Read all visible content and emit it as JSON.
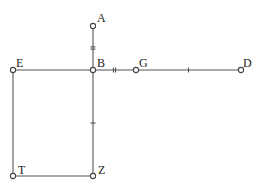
{
  "diagram": {
    "type": "geometry-figure",
    "points": [
      {
        "id": "A",
        "label": "A",
        "x": 93,
        "y": 26,
        "lx": 97,
        "ly": 22
      },
      {
        "id": "B",
        "label": "B",
        "x": 93,
        "y": 70,
        "lx": 97,
        "ly": 67
      },
      {
        "id": "E",
        "label": "E",
        "x": 13,
        "y": 70,
        "lx": 16,
        "ly": 67
      },
      {
        "id": "G",
        "label": "G",
        "x": 136,
        "y": 70,
        "lx": 139,
        "ly": 67
      },
      {
        "id": "D",
        "label": "D",
        "x": 241,
        "y": 70,
        "lx": 243,
        "ly": 67
      },
      {
        "id": "T",
        "label": "T",
        "x": 13,
        "y": 176,
        "lx": 18,
        "ly": 174
      },
      {
        "id": "Z",
        "label": "Z",
        "x": 93,
        "y": 176,
        "lx": 98,
        "ly": 174
      }
    ],
    "segments": [
      {
        "from": "A",
        "to": "B",
        "ticks": 2,
        "orientation": "vertical"
      },
      {
        "from": "E",
        "to": "B",
        "ticks": 0,
        "orientation": "horizontal"
      },
      {
        "from": "B",
        "to": "G",
        "ticks": 2,
        "orientation": "horizontal"
      },
      {
        "from": "G",
        "to": "D",
        "ticks": 1,
        "orientation": "horizontal"
      },
      {
        "from": "B",
        "to": "Z",
        "ticks": 1,
        "orientation": "vertical"
      },
      {
        "from": "E",
        "to": "T",
        "ticks": 0,
        "orientation": "vertical"
      },
      {
        "from": "T",
        "to": "Z",
        "ticks": 0,
        "orientation": "horizontal"
      }
    ],
    "colors": {
      "line": "#555555",
      "point_fill": "#ffffff",
      "text": "#222222"
    }
  }
}
